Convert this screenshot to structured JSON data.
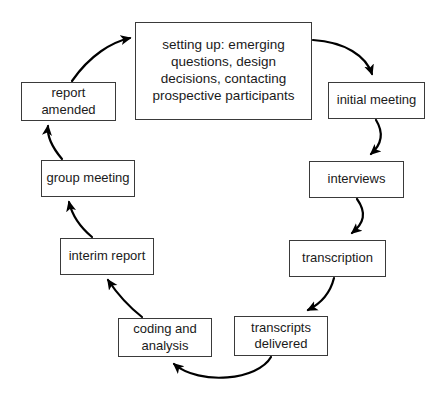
{
  "diagram": {
    "type": "cycle-flowchart",
    "direction": "clockwise",
    "colors": {
      "background": "#ffffff",
      "box_border": "#3a3a3a",
      "box_fill": "#ffffff",
      "text": "#1a1a1a",
      "arrow": "#000000"
    },
    "nodes": [
      {
        "id": "setting_up",
        "label": "setting up: emerging\nquestions, design\ndecisions, contacting\nprospective participants"
      },
      {
        "id": "initial_meeting",
        "label": "initial meeting"
      },
      {
        "id": "interviews",
        "label": "interviews"
      },
      {
        "id": "transcription",
        "label": "transcription"
      },
      {
        "id": "transcripts_delivered",
        "label": "transcripts\ndelivered"
      },
      {
        "id": "coding_analysis",
        "label": "coding and\nanalysis"
      },
      {
        "id": "interim_report",
        "label": "interim report"
      },
      {
        "id": "group_meeting",
        "label": "group meeting"
      },
      {
        "id": "report_amended",
        "label": "report\namended"
      }
    ],
    "edges": [
      {
        "from": "setting_up",
        "to": "initial_meeting"
      },
      {
        "from": "initial_meeting",
        "to": "interviews"
      },
      {
        "from": "interviews",
        "to": "transcription"
      },
      {
        "from": "transcription",
        "to": "transcripts_delivered"
      },
      {
        "from": "transcripts_delivered",
        "to": "coding_analysis"
      },
      {
        "from": "coding_analysis",
        "to": "interim_report"
      },
      {
        "from": "interim_report",
        "to": "group_meeting"
      },
      {
        "from": "group_meeting",
        "to": "report_amended"
      },
      {
        "from": "report_amended",
        "to": "setting_up"
      }
    ]
  }
}
